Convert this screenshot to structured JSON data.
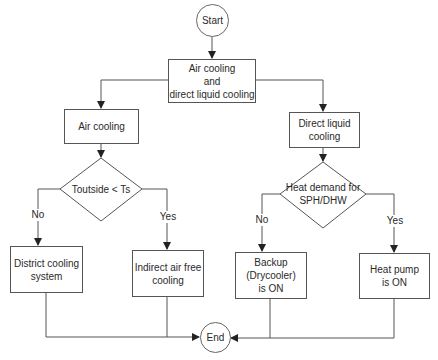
{
  "diagram": {
    "type": "flowchart",
    "colors": {
      "stroke": "#555555",
      "text": "#2a2a2a",
      "background": "#ffffff"
    },
    "nodes": {
      "start": {
        "label": "Start",
        "shape": "circle"
      },
      "combined": {
        "label": "Air cooling\nand\ndirect liquid cooling",
        "shape": "rectangle"
      },
      "air_cooling": {
        "label": "Air cooling",
        "shape": "rectangle"
      },
      "liquid_cooling": {
        "label": "Direct liquid\ncooling",
        "shape": "rectangle"
      },
      "decision_temp": {
        "label": "Toutside < Ts",
        "shape": "diamond"
      },
      "decision_heat": {
        "label": "Heat demand for\nSPH/DHW",
        "shape": "diamond"
      },
      "district": {
        "label": "District cooling\nsystem",
        "shape": "rectangle"
      },
      "indirect_air": {
        "label": "Indirect air free\ncooling",
        "shape": "rectangle"
      },
      "backup": {
        "label": "Backup\n(Drycooler)\nis ON",
        "shape": "rectangle"
      },
      "heat_pump": {
        "label": "Heat pump\nis ON",
        "shape": "rectangle"
      },
      "end": {
        "label": "End",
        "shape": "circle"
      }
    },
    "edge_labels": {
      "temp_no": "No",
      "temp_yes": "Yes",
      "heat_no": "No",
      "heat_yes": "Yes"
    },
    "edges": [
      [
        "start",
        "combined"
      ],
      [
        "combined",
        "air_cooling"
      ],
      [
        "combined",
        "liquid_cooling"
      ],
      [
        "air_cooling",
        "decision_temp"
      ],
      [
        "liquid_cooling",
        "decision_heat"
      ],
      [
        "decision_temp",
        "district",
        "No"
      ],
      [
        "decision_temp",
        "indirect_air",
        "Yes"
      ],
      [
        "decision_heat",
        "backup",
        "No"
      ],
      [
        "decision_heat",
        "heat_pump",
        "Yes"
      ],
      [
        "district",
        "end"
      ],
      [
        "indirect_air",
        "end"
      ],
      [
        "backup",
        "end"
      ],
      [
        "heat_pump",
        "end"
      ]
    ]
  }
}
